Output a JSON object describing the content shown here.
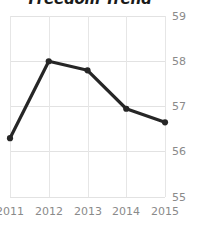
{
  "chart_data": {
    "type": "line",
    "title": "Freedom Trend",
    "xlabel": "",
    "ylabel": "",
    "categories": [
      "2011",
      "2012",
      "2013",
      "2014",
      "2015"
    ],
    "x": [
      2011,
      2012,
      2013,
      2014,
      2015
    ],
    "values": [
      56.3,
      58.0,
      57.8,
      56.95,
      56.65
    ],
    "series": [
      {
        "name": "Freedom Trend",
        "values": [
          56.3,
          58.0,
          57.8,
          56.95,
          56.65
        ]
      }
    ],
    "ylim": [
      55,
      59
    ],
    "yticks": [
      55,
      56,
      57,
      58,
      59
    ],
    "ytick_labels": [
      "55",
      "56",
      "57",
      "58",
      "59"
    ],
    "xtick_labels": [
      "2011",
      "2012",
      "2013",
      "2014",
      "2015"
    ],
    "grid": true,
    "y_axis_position": "right",
    "legend": false,
    "legend_position": "none",
    "marker": "circle",
    "colors": {
      "line": "#262626",
      "marker": "#262626",
      "grid": "#e2e2e2",
      "tick_label": "#8a8a8a",
      "title": "#1a1a1a",
      "background": "#ffffff"
    }
  },
  "axis": {
    "y_ticks": [
      {
        "label": "59"
      },
      {
        "label": "58"
      },
      {
        "label": "57"
      },
      {
        "label": "56"
      },
      {
        "label": "55"
      }
    ],
    "x_ticks": [
      {
        "label": "2011"
      },
      {
        "label": "2012"
      },
      {
        "label": "2013"
      },
      {
        "label": "2014"
      },
      {
        "label": "2015"
      }
    ]
  }
}
